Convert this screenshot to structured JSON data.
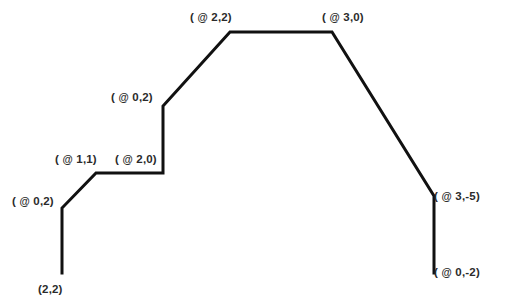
{
  "diagram": {
    "type": "polyline",
    "stroke_color": "#111111",
    "stroke_width": 3,
    "background_color": "#ffffff",
    "label_color": "#2b2b2b",
    "start_point_label": "(2,2)",
    "vertices": [
      {
        "x": 62,
        "y": 273
      },
      {
        "x": 62,
        "y": 208
      },
      {
        "x": 96,
        "y": 173
      },
      {
        "x": 163,
        "y": 173
      },
      {
        "x": 163,
        "y": 106
      },
      {
        "x": 230,
        "y": 32
      },
      {
        "x": 332,
        "y": 32
      },
      {
        "x": 434,
        "y": 196
      },
      {
        "x": 434,
        "y": 273
      }
    ],
    "labels": [
      {
        "text": "( @ 0,2)",
        "x": 12,
        "y": 194
      },
      {
        "text": "( @ 1,1)",
        "x": 55,
        "y": 152
      },
      {
        "text": "( @ 2,0)",
        "x": 115,
        "y": 152
      },
      {
        "text": "( @ 0,2)",
        "x": 111,
        "y": 90
      },
      {
        "text": "( @ 2,2)",
        "x": 190,
        "y": 10
      },
      {
        "text": "( @ 3,0)",
        "x": 322,
        "y": 10
      },
      {
        "text": "( @ 3,-5)",
        "x": 434,
        "y": 189
      },
      {
        "text": "( @ 0,-2)",
        "x": 434,
        "y": 265
      },
      {
        "text": "(2,2)",
        "x": 38,
        "y": 282
      }
    ]
  }
}
